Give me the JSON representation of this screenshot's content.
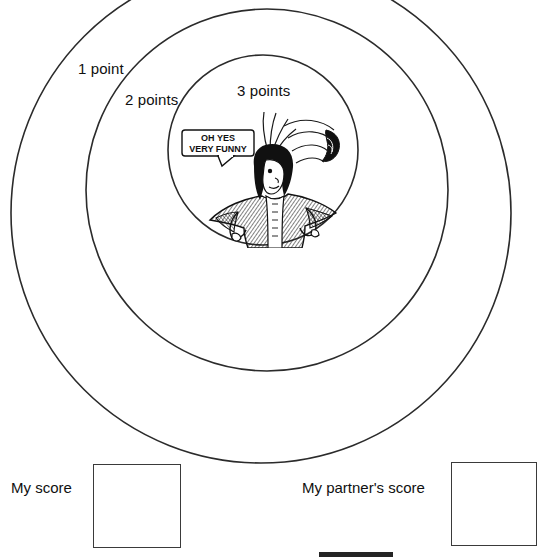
{
  "page": {
    "background_color": "#ffffff",
    "line_color": "#2b2b2b",
    "text_color": "#101010"
  },
  "target": {
    "description": "Three concentric circles forming a dartboard-style target",
    "rings": [
      {
        "id": "outer",
        "label": "1 point",
        "points": 1,
        "cx": 261,
        "cy": 213,
        "r": 250
      },
      {
        "id": "middle",
        "label": "2 points",
        "points": 2,
        "cx": 267,
        "cy": 190,
        "r": 181
      },
      {
        "id": "inner",
        "label": "3 points",
        "points": 3,
        "cx": 263,
        "cy": 150,
        "r": 95
      }
    ]
  },
  "labels": {
    "one_point": "1 point",
    "two_points": "2 points",
    "three_points": "3 points"
  },
  "cartoon": {
    "name": "cavalier-character",
    "description": "Cartoon man with long curly hair, a plumed hat flying off his head, arms on hips, wearing a long coat",
    "speech_bubble": {
      "line1": "OH YES",
      "line2": "VERY FUNNY"
    }
  },
  "score_fields": [
    {
      "id": "my-score",
      "label": "My score",
      "value": ""
    },
    {
      "id": "partner-score",
      "label": "My partner's score",
      "value": ""
    }
  ],
  "footer": {
    "bar_color": "#242424"
  }
}
